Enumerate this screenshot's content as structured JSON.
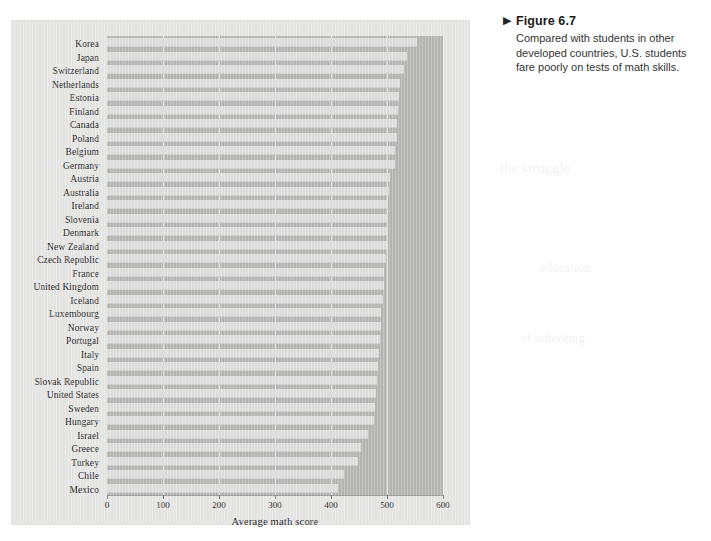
{
  "figure": {
    "marker": "▶",
    "title": "Figure 6.7",
    "caption": "Compared with students in other developed countries, U.S. students fare poorly on tests of math skills."
  },
  "chart_data": {
    "type": "bar",
    "orientation": "horizontal",
    "title": "",
    "xlabel": "Average math score",
    "ylabel": "",
    "xlim": [
      0,
      600
    ],
    "xticks": [
      0,
      100,
      200,
      300,
      400,
      500,
      600
    ],
    "grid": true,
    "legend": null,
    "categories": [
      "Korea",
      "Japan",
      "Switzerland",
      "Netherlands",
      "Estonia",
      "Finland",
      "Canada",
      "Poland",
      "Belgium",
      "Germany",
      "Austria",
      "Australia",
      "Ireland",
      "Slovenia",
      "Denmark",
      "New Zealand",
      "Czech Republic",
      "France",
      "United Kingdom",
      "Iceland",
      "Luxembourg",
      "Norway",
      "Portugal",
      "Italy",
      "Spain",
      "Slovak Republic",
      "United States",
      "Sweden",
      "Hungary",
      "Israel",
      "Greece",
      "Turkey",
      "Chile",
      "Mexico"
    ],
    "values": [
      554,
      536,
      531,
      523,
      521,
      519,
      518,
      518,
      515,
      514,
      506,
      504,
      501,
      501,
      500,
      500,
      499,
      495,
      494,
      493,
      490,
      489,
      487,
      485,
      484,
      482,
      481,
      478,
      477,
      466,
      453,
      448,
      423,
      413
    ],
    "bar_color": "#dedede",
    "plot_background": "#b5b5b3"
  }
}
